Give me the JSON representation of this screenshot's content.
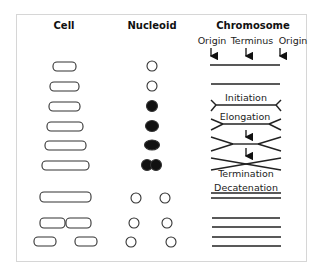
{
  "diagram": {
    "columns": {
      "cell": "Cell",
      "nucleoid": "Nucleoid",
      "chromosome": "Chromosome"
    },
    "chromosome_markers": {
      "left": "Origin",
      "center": "Terminus",
      "right": "Origin"
    },
    "stages": {
      "initiation": "Initiation",
      "elongation": "Elongation",
      "termination": "Termination",
      "decatenation": "Decatenation"
    },
    "cell_rows": [
      {
        "row": 1,
        "cells": 1,
        "nucleoid": "hollow circle"
      },
      {
        "row": 2,
        "cells": 1,
        "nucleoid": "hollow circle"
      },
      {
        "row": 3,
        "cells": 1,
        "nucleoid": "filled circle"
      },
      {
        "row": 4,
        "cells": 1,
        "nucleoid": "filled circle"
      },
      {
        "row": 5,
        "cells": 1,
        "nucleoid": "filled oval"
      },
      {
        "row": 6,
        "cells": 1,
        "nucleoid": "filled double circle"
      },
      {
        "row": 7,
        "cells": 1,
        "nucleoid": "two hollow circles"
      },
      {
        "row": 8,
        "cells": 2,
        "nucleoid": "two hollow circles",
        "note": "dividing"
      },
      {
        "row": 9,
        "cells": 2,
        "nucleoid": "two hollow circles",
        "note": "separated"
      }
    ],
    "colors": {
      "stroke": "#222222",
      "frame": "#d6d6d6",
      "background": "#ffffff"
    }
  }
}
